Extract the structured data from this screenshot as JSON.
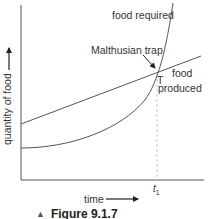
{
  "figure": {
    "caption_marker": "▲",
    "caption": "Figure 9.1.7"
  },
  "axes": {
    "y_label": "quantity of food",
    "x_label": "time",
    "x_tick_label": "t",
    "x_tick_subscript": "1"
  },
  "curves": {
    "exponential_label": "food required",
    "linear_label_line1": "food",
    "linear_label_line2": "produced"
  },
  "annotations": {
    "trap_label": "Malthusian trap",
    "intersection_label": "T"
  },
  "colors": {
    "line": "#555555",
    "axis": "#444444",
    "dashed": "#bbbbbb",
    "text": "#333333"
  }
}
